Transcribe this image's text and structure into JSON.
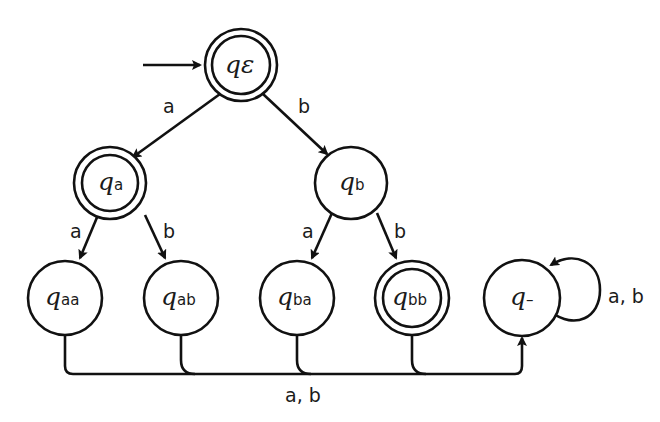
{
  "diagram": {
    "type": "DFA",
    "start_state": "q_eps",
    "states": [
      {
        "id": "q_eps",
        "base": "q",
        "sub": "ε",
        "accepting": true
      },
      {
        "id": "q_a",
        "base": "q",
        "sub": "a",
        "accepting": true
      },
      {
        "id": "q_b",
        "base": "q",
        "sub": "b",
        "accepting": false
      },
      {
        "id": "q_aa",
        "base": "q",
        "sub": "aa",
        "accepting": false
      },
      {
        "id": "q_ab",
        "base": "q",
        "sub": "ab",
        "accepting": false
      },
      {
        "id": "q_ba",
        "base": "q",
        "sub": "ba",
        "accepting": false
      },
      {
        "id": "q_bb",
        "base": "q",
        "sub": "bb",
        "accepting": true
      },
      {
        "id": "q_dead",
        "base": "q",
        "sub": "–",
        "accepting": false
      }
    ],
    "edge_labels": {
      "eps_a": "a",
      "eps_b": "b",
      "a_a": "a",
      "a_b": "b",
      "b_a": "a",
      "b_b": "b",
      "to_dead": "a, b",
      "dead_loop": "a, b"
    }
  }
}
